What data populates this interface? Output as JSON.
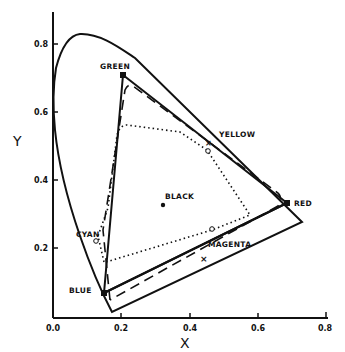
{
  "diagram": {
    "type": "CIE chromaticity diagram",
    "axes": {
      "x_label": "X",
      "y_label": "Y",
      "x_ticks": [
        "0.0",
        "0.2",
        "0.4",
        "0.6",
        "0.8"
      ],
      "y_ticks": [
        "0.2",
        "0.4",
        "0.6",
        "0.8"
      ],
      "x_range": [
        0.0,
        0.8
      ],
      "y_range": [
        0.0,
        0.85
      ]
    },
    "labels": {
      "green": "GREEN",
      "yellow": "YELLOW",
      "red": "RED",
      "black": "BLACK",
      "cyan": "CYAN",
      "magenta": "MAGENTA",
      "blue": "BLUE"
    },
    "primaries": {
      "green": [
        0.21,
        0.71
      ],
      "red": [
        0.67,
        0.33
      ],
      "blue": [
        0.15,
        0.07
      ]
    },
    "points": {
      "black": [
        0.32,
        0.32
      ],
      "yellow_x": [
        0.44,
        0.51
      ],
      "yellow_o": [
        0.45,
        0.49
      ],
      "cyan_o": [
        0.13,
        0.22
      ],
      "magenta_o": [
        0.46,
        0.25
      ],
      "magenta_x": [
        0.44,
        0.16
      ]
    }
  }
}
